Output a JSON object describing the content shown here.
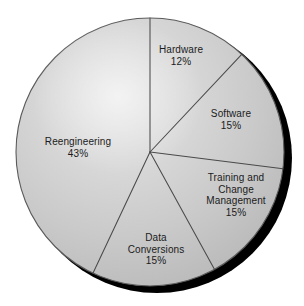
{
  "chart_data": {
    "type": "pie",
    "title": "",
    "subtitle": "",
    "xlabel": "",
    "ylabel": "",
    "legend_position": "none",
    "grid": false,
    "value_unit": "%",
    "start_angle_deg": 0,
    "direction": "clockwise",
    "categories": [
      "Hardware",
      "Software",
      "Training and Change Management",
      "Data Conversions",
      "Reengineering"
    ],
    "values": [
      12,
      15,
      15,
      15,
      43
    ],
    "slices": [
      {
        "name": "Hardware",
        "value": 12,
        "value_text": "12%",
        "label_lines": [
          "Hardware",
          "12%"
        ],
        "start_deg": 0,
        "end_deg": 43.2,
        "fill": "#cfcfcf"
      },
      {
        "name": "Software",
        "value": 15,
        "value_text": "15%",
        "label_lines": [
          "Software",
          "15%"
        ],
        "start_deg": 43.2,
        "end_deg": 97.2,
        "fill": "#c8c8c8"
      },
      {
        "name": "Training and Change Management",
        "value": 15,
        "value_text": "15%",
        "label_lines": [
          "Training and",
          "Change",
          "Management",
          "15%"
        ],
        "start_deg": 97.2,
        "end_deg": 151.2,
        "fill": "#c2c2c2"
      },
      {
        "name": "Data Conversions",
        "value": 15,
        "value_text": "15%",
        "label_lines": [
          "Data",
          "Conversions",
          "15%"
        ],
        "start_deg": 151.2,
        "end_deg": 205.2,
        "fill": "#c6c6c6"
      },
      {
        "name": "Reengineering",
        "value": 43,
        "value_text": "43%",
        "label_lines": [
          "Reengineering",
          "43%"
        ],
        "start_deg": 205.2,
        "end_deg": 360,
        "fill": "#cccccc"
      }
    ],
    "colors": {
      "fill_light": "#dcdcdc",
      "fill_mid": "#cbcbcb",
      "fill_dark": "#b2b2b2",
      "separator": "#4a4a4a",
      "outline": "#5a5a5a",
      "shadow": "#000000",
      "text": "#1b1b1b",
      "background": "#ffffff"
    }
  },
  "labels": {
    "hardware": {
      "line1": "Hardware",
      "line2": "12%"
    },
    "software": {
      "line1": "Software",
      "line2": "15%"
    },
    "training": {
      "line1": "Training and",
      "line2": "Change",
      "line3": "Management",
      "line4": "15%"
    },
    "data_conversions": {
      "line1": "Data",
      "line2": "Conversions",
      "line3": "15%"
    },
    "reengineering": {
      "line1": "Reengineering",
      "line2": "43%"
    }
  }
}
